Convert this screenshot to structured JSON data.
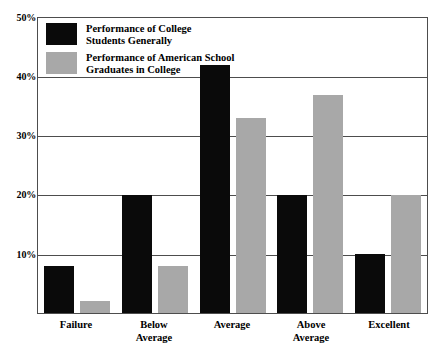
{
  "chart_data": {
    "type": "bar",
    "title": "",
    "xlabel": "",
    "ylabel": "",
    "ylim": [
      0,
      50
    ],
    "ytick_labels": [
      "50%",
      "40%",
      "30%",
      "20%",
      "10%"
    ],
    "ytick_values": [
      50,
      40,
      30,
      20,
      10
    ],
    "grid": true,
    "legend_position": "top-left",
    "categories": [
      "Failure",
      "Below\nAverage",
      "Average",
      "Above\nAverage",
      "Excellent"
    ],
    "series": [
      {
        "name": "Performance of College\nStudents Generally",
        "color": "#0a0a0a",
        "values": [
          8,
          20,
          42,
          20,
          10
        ]
      },
      {
        "name": "Performance of American School\nGraduates in College",
        "color": "#a8a8a8",
        "values": [
          2,
          8,
          33,
          37,
          20
        ]
      }
    ]
  },
  "axis": {
    "y0": "10%",
    "y1": "20%",
    "y2": "30%",
    "y3": "40%",
    "y4": "50%"
  },
  "legend": {
    "series0_label": "Performance of College\nStudents Generally",
    "series1_label": "Performance of American School\nGraduates in College"
  },
  "xlabels": {
    "c0": "Failure",
    "c1": "Below\nAverage",
    "c2": "Average",
    "c3": "Above\nAverage",
    "c4": "Excellent"
  }
}
